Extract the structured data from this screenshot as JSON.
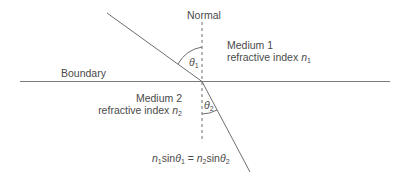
{
  "diagram": {
    "labels": {
      "normal": "Normal",
      "boundary": "Boundary",
      "medium1_name": "Medium 1",
      "medium1_index_text": "refractive index ",
      "medium1_index_symbol": "n",
      "medium1_index_sub": "1",
      "medium2_name": "Medium 2",
      "medium2_index_text": "refractive index ",
      "medium2_index_symbol": "n",
      "medium2_index_sub": "2",
      "theta1_symbol": "θ",
      "theta1_sub": "1",
      "theta2_symbol": "θ",
      "theta2_sub": "2"
    },
    "equation": {
      "lhs_n": "n",
      "lhs_n_sub": "1",
      "lhs_sin": "sin",
      "lhs_theta": "θ",
      "lhs_theta_sub": "1",
      "equals": " = ",
      "rhs_n": "n",
      "rhs_n_sub": "2",
      "rhs_sin": "sin",
      "rhs_theta": "θ",
      "rhs_theta_sub": "2"
    },
    "colors": {
      "line": "#6e6e6e",
      "text": "#4a4a4a",
      "background": "#ffffff"
    }
  }
}
